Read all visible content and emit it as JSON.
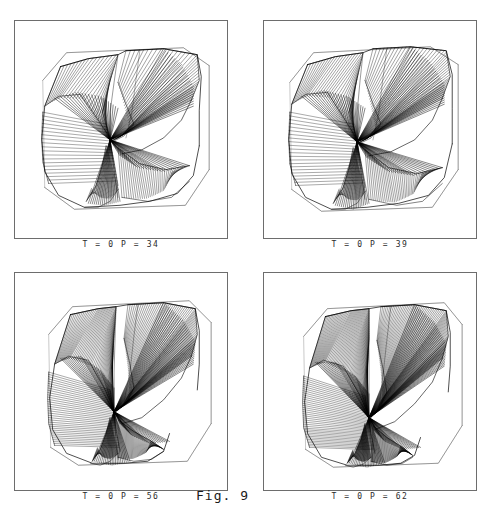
{
  "figure": {
    "label": "Fig. 9",
    "header_note": "",
    "background": "#ffffff",
    "ink": "#000000",
    "frame_color": "#6d6d6d"
  },
  "panels": [
    {
      "id": "panel-1",
      "caption": "T = 0   P = 34",
      "params": {
        "T": "0",
        "P": "34"
      }
    },
    {
      "id": "panel-2",
      "caption": "T = 0   P = 39",
      "params": {
        "T": "0",
        "P": "39"
      }
    },
    {
      "id": "panel-3",
      "caption": "T = 0   P = 56",
      "params": {
        "T": "0",
        "P": "56"
      }
    },
    {
      "id": "panel-4",
      "caption": "T = 0   P = 62",
      "params": {
        "T": "0",
        "P": "62"
      }
    }
  ],
  "chart_data": {
    "type": "line",
    "title": "Fig. 9",
    "subtitle": "Ruled-surface wireframe projections of a twisted saddle sheet",
    "xlabel": "",
    "ylabel": "",
    "legend": [],
    "grid": false,
    "series": [
      {
        "name": "T = 0  P = 34",
        "params": {
          "T": 0,
          "P": 34
        },
        "generators": 34,
        "pinch_point": [
          0.46,
          0.55
        ],
        "lobes": [
          "upper-left",
          "upper-right",
          "lower-left",
          "lower-right"
        ]
      },
      {
        "name": "T = 0  P = 39",
        "params": {
          "T": 0,
          "P": 39
        },
        "generators": 39,
        "pinch_point": [
          0.44,
          0.56
        ],
        "lobes": [
          "upper-left",
          "upper-right",
          "lower-left",
          "lower-right"
        ]
      },
      {
        "name": "T = 0  P = 56",
        "params": {
          "T": 0,
          "P": 56
        },
        "generators": 56,
        "pinch_point": [
          0.47,
          0.63
        ],
        "lobes": [
          "upper-left",
          "upper-right",
          "lower-left",
          "lower-right"
        ]
      },
      {
        "name": "T = 0  P = 62",
        "params": {
          "T": 0,
          "P": 62
        },
        "generators": 62,
        "pinch_point": [
          0.5,
          0.66
        ],
        "lobes": [
          "upper-left",
          "upper-right",
          "lower-left",
          "lower-right"
        ]
      }
    ],
    "x": [
      34,
      39,
      56,
      62
    ],
    "values": [
      34,
      39,
      56,
      62
    ]
  }
}
